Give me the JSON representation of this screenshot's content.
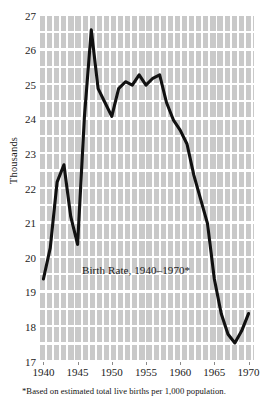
{
  "figure": {
    "title_in_plot": "Birth Rate, 1940–1970*",
    "footnote": "*Based on estimated total live births per 1,000 population.",
    "ylabel": "Thousands"
  },
  "colors": {
    "plot_background": "#c9c9c9",
    "gridline": "#ffffff",
    "line": "#111111",
    "page_background": "#ffffff",
    "text": "#1a1a1a"
  },
  "chart_data": {
    "type": "line",
    "title": "Birth Rate, 1940–1970*",
    "xlabel": "",
    "ylabel": "Thousands",
    "xlim": [
      1939.5,
      1970.8
    ],
    "ylim": [
      17,
      27
    ],
    "grid": true,
    "legend": null,
    "xticks": [
      1940,
      1945,
      1950,
      1955,
      1960,
      1965,
      1970
    ],
    "xtick_labels": [
      "1940",
      "1945",
      "1950",
      "1955",
      "1960",
      "1965",
      "1970"
    ],
    "yticks": [
      17,
      18,
      19,
      20,
      21,
      22,
      23,
      24,
      25,
      26,
      27
    ],
    "ytick_labels": [
      "17",
      "18",
      "19",
      "20",
      "21",
      "22",
      "23",
      "24",
      "25",
      "26",
      "27"
    ],
    "x": [
      1940,
      1941,
      1942,
      1943,
      1944,
      1945,
      1946,
      1947,
      1948,
      1949,
      1950,
      1951,
      1952,
      1953,
      1954,
      1955,
      1956,
      1957,
      1958,
      1959,
      1960,
      1961,
      1962,
      1963,
      1964,
      1965,
      1966,
      1967,
      1968,
      1969,
      1970
    ],
    "values": [
      19.4,
      20.3,
      22.2,
      22.7,
      21.2,
      20.4,
      24.1,
      26.6,
      24.9,
      24.5,
      24.1,
      24.9,
      25.1,
      25.0,
      25.3,
      25.0,
      25.2,
      25.3,
      24.5,
      24.0,
      23.7,
      23.3,
      22.4,
      21.7,
      21.0,
      19.4,
      18.4,
      17.8,
      17.55,
      17.9,
      18.4
    ],
    "series": [
      {
        "name": "Birth rate per 1,000 population",
        "values": [
          19.4,
          20.3,
          22.2,
          22.7,
          21.2,
          20.4,
          24.1,
          26.6,
          24.9,
          24.5,
          24.1,
          24.9,
          25.1,
          25.0,
          25.3,
          25.0,
          25.2,
          25.3,
          24.5,
          24.0,
          23.7,
          23.3,
          22.4,
          21.7,
          21.0,
          19.4,
          18.4,
          17.8,
          17.55,
          17.9,
          18.4
        ]
      }
    ],
    "annotations": [
      {
        "text": "Birth Rate, 1940–1970*",
        "x": 1952.8,
        "y": 19.6
      }
    ]
  }
}
